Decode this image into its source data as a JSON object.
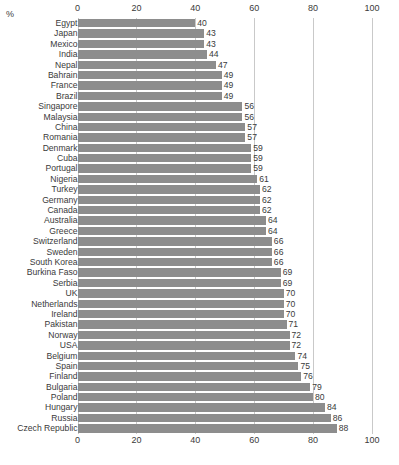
{
  "chart": {
    "type": "bar",
    "orientation": "horizontal",
    "axis_corner_label": "%",
    "bar_color": "#8d8d8d",
    "grid_color": "#c9c9c9",
    "text_color": "#3a3a3a"
  },
  "chart_data": {
    "type": "bar",
    "title": "",
    "xlabel": "%",
    "ylabel": "",
    "xlim": [
      0,
      100
    ],
    "grid": true,
    "legend": "none",
    "orientation": "horizontal",
    "xticks": [
      "0",
      "20",
      "40",
      "60",
      "80",
      "100"
    ],
    "xtick_values": [
      0,
      20,
      40,
      60,
      80,
      100
    ],
    "axis_positions": "top and bottom",
    "categories": [
      "Egypt",
      "Japan",
      "Mexico",
      "India",
      "Nepal",
      "Bahrain",
      "France",
      "Brazil",
      "Singapore",
      "Malaysia",
      "China",
      "Romania",
      "Denmark",
      "Cuba",
      "Portugal",
      "Nigeria",
      "Turkey",
      "Germany",
      "Canada",
      "Australia",
      "Greece",
      "Switzerland",
      "Sweden",
      "South Korea",
      "Burkina Faso",
      "Serbia",
      "UK",
      "Netherlands",
      "Ireland",
      "Pakistan",
      "Norway",
      "USA",
      "Belgium",
      "Spain",
      "Finland",
      "Bulgaria",
      "Poland",
      "Hungary",
      "Russia",
      "Czech Republic"
    ],
    "values": [
      40,
      43,
      43,
      44,
      47,
      49,
      49,
      49,
      56,
      56,
      57,
      57,
      59,
      59,
      59,
      61,
      62,
      62,
      62,
      64,
      64,
      66,
      66,
      66,
      69,
      69,
      70,
      70,
      70,
      71,
      72,
      72,
      74,
      75,
      76,
      79,
      80,
      84,
      86,
      88
    ],
    "value_labels": [
      "40",
      "43",
      "43",
      "44",
      "47",
      "49",
      "49",
      "49",
      "56",
      "56",
      "57",
      "57",
      "59",
      "59",
      "59",
      "61",
      "62",
      "62",
      "62",
      "64",
      "64",
      "66",
      "66",
      "66",
      "69",
      "69",
      "70",
      "70",
      "70",
      "71",
      "72",
      "72",
      "74",
      "75",
      "76",
      "79",
      "80",
      "84",
      "86",
      "88"
    ]
  }
}
